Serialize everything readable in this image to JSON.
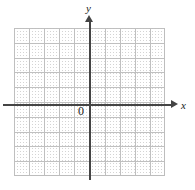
{
  "figure": {
    "width": 195,
    "height": 190,
    "background_color": "#ffffff"
  },
  "axes": {
    "x_axis_label": "x",
    "y_axis_label": "y",
    "origin_label": "0",
    "axis_color": "#444444",
    "x_axis_arrow": "arrow-right",
    "y_axis_arrow": "arrow-up"
  },
  "grid": {
    "dot_color": "#d4d4d4",
    "line_color": "#bdbdbd",
    "columns": 10,
    "rows": 10,
    "cell_size_px": 15
  },
  "chart_data": {
    "type": "scatter",
    "title": "",
    "subtitle": "",
    "xlabel": "x",
    "ylabel": "y",
    "xlim": [
      -5,
      5
    ],
    "ylim": [
      -5,
      5
    ],
    "xticks": [
      -5,
      -4,
      -3,
      -2,
      -1,
      0,
      1,
      2,
      3,
      4,
      5
    ],
    "yticks": [
      -5,
      -4,
      -3,
      -2,
      -1,
      0,
      1,
      2,
      3,
      4,
      5
    ],
    "xtick_labels": [
      "",
      "",
      "",
      "",
      "",
      "0",
      "",
      "",
      "",
      "",
      ""
    ],
    "ytick_labels": [
      "",
      "",
      "",
      "",
      "",
      "",
      "",
      "",
      "",
      "",
      ""
    ],
    "grid": true,
    "grid_style": "dotted",
    "legend": false,
    "legend_position": "none",
    "annotations": [
      {
        "text": "0",
        "x": -0.35,
        "y": -0.45,
        "role": "origin-label"
      },
      {
        "text": "x",
        "x": 5.6,
        "y": 0.15,
        "role": "x-axis-label"
      },
      {
        "text": "y",
        "x": 0.0,
        "y": 5.9,
        "role": "y-axis-label"
      }
    ],
    "series": [
      {
        "name": "",
        "x": [],
        "y": []
      }
    ]
  }
}
